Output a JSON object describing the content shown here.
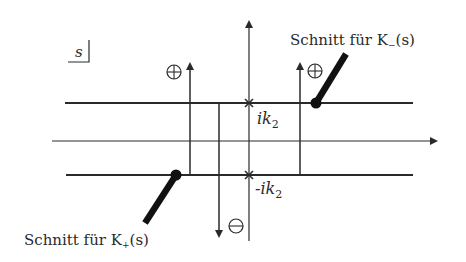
{
  "diagram": {
    "type": "complex-plane contour diagram",
    "plane_label": "s",
    "colors": {
      "line": "#2a2a2a",
      "background": "#ffffff"
    },
    "labels": {
      "cut_minus": "Schnitt für K",
      "cut_minus_sub": "−",
      "cut_minus_arg": "(s)",
      "cut_plus": "Schnitt für K",
      "cut_plus_sub": "+",
      "cut_plus_arg": "(s)",
      "pole_upper": "ik",
      "pole_upper_sub": "2",
      "pole_lower": "-ik",
      "pole_lower_sub": "2",
      "plus_symbol": "⊕",
      "minus_symbol": "⊖"
    },
    "elements": [
      "real axis arrow",
      "imaginary axis arrow",
      "strip line upper at ik2",
      "strip line lower at -ik2",
      "contour left upward (plus)",
      "contour middle downward (minus)",
      "contour right upward (plus)",
      "branch cut K- from ik2 region upward-right",
      "branch cut K+ from -ik2 region downward-left"
    ]
  }
}
